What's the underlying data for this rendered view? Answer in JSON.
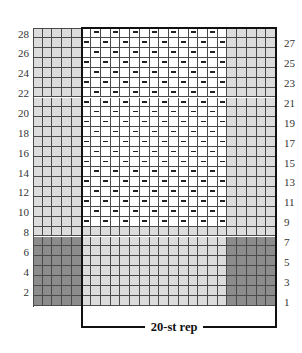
{
  "chart_data": {
    "type": "knitting-chart",
    "title": "",
    "columns": 25,
    "rows": 28,
    "left_row_labels": [
      2,
      4,
      6,
      8,
      10,
      12,
      14,
      16,
      18,
      20,
      22,
      24,
      26,
      28
    ],
    "right_row_labels": [
      1,
      3,
      5,
      7,
      9,
      11,
      13,
      15,
      17,
      19,
      21,
      23,
      25,
      27
    ],
    "repeat": {
      "label": "20-st rep",
      "start_col": 6,
      "end_col": 25
    },
    "regions": [
      {
        "name": "left-edge-contrast",
        "cols": [
          1,
          5
        ],
        "rows": [
          1,
          7
        ],
        "color": "#8c8c8c"
      },
      {
        "name": "right-edge-contrast",
        "cols": [
          21,
          25
        ],
        "rows": [
          1,
          7
        ],
        "color": "#8c8c8c"
      },
      {
        "name": "center-main-color-band",
        "cols": [
          6,
          20
        ],
        "rows": [
          1,
          8
        ],
        "color": "#dcdcdc"
      },
      {
        "name": "left-edge-main-color",
        "cols": [
          1,
          5
        ],
        "rows": [
          8,
          28
        ],
        "color": "#dcdcdc"
      },
      {
        "name": "right-edge-main-color",
        "cols": [
          21,
          25
        ],
        "rows": [
          8,
          28
        ],
        "color": "#dcdcdc"
      },
      {
        "name": "pattern-area",
        "cols": [
          6,
          20
        ],
        "rows": [
          9,
          28
        ],
        "color": "#ffffff"
      }
    ],
    "symbols": {
      "dash": "purl",
      "pattern": "Odd rows (9-27): dash on pattern cols 1,3,5,...,15 (chart cols 6,8,...,20). Even rows (10-28): dash on pattern cols 2,4,...,14 (chart cols 7,9,...,19)."
    }
  },
  "colors": {
    "dark": "#8c8c8c",
    "light": "#dcdcdc",
    "white": "#ffffff",
    "grid_line": "#4a4a4a",
    "box_line": "#111111"
  },
  "labels": {
    "repeat": "20-st rep"
  }
}
